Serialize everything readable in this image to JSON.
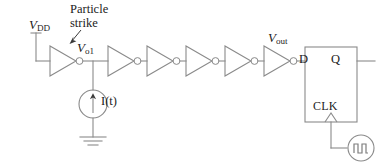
{
  "diagram": {
    "type": "circuit-schematic",
    "colors": {
      "wire": "#8a8a8a",
      "text": "#1c1c1c",
      "annotation": "#3a3a3a",
      "background": "#ffffff"
    }
  },
  "labels": {
    "vdd": {
      "base": "V",
      "sub": "DD",
      "full": "VDD"
    },
    "particle_strike": {
      "line1": "Particle",
      "line2": "strike"
    },
    "node_vo1": {
      "base": "V",
      "sub": "o1",
      "full": "Vo1"
    },
    "current_source": {
      "text": "I(t)"
    },
    "node_vout": {
      "base": "V",
      "sub": "out",
      "full": "Vout"
    },
    "flipflop_d": "D",
    "flipflop_q": "Q",
    "flipflop_clk": "CLK"
  },
  "components": {
    "supply_terminal": {
      "name": "vdd-terminal",
      "count": 1
    },
    "inverters": {
      "count": 6,
      "symbol": "triangle-with-bubble"
    },
    "current_source": {
      "symbol": "circle-with-up-arrow",
      "label": "I(t)"
    },
    "ground": {
      "symbol": "ground-bars",
      "bars": 3
    },
    "flip_flop": {
      "symbol": "rectangle",
      "pins": [
        "D",
        "Q",
        "CLK"
      ],
      "clock_edge": "rising"
    },
    "clock_source": {
      "symbol": "circle-with-square-wave"
    },
    "annotation_arrow": {
      "points_to": "node_vo1",
      "direction": "down-left"
    }
  }
}
